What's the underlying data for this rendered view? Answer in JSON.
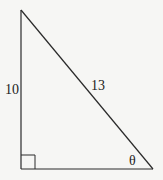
{
  "diagram": {
    "type": "right-triangle",
    "background": "#f6f6f4",
    "stroke_color": "#2a2a2a",
    "vertices": {
      "top": [
        21,
        10
      ],
      "right_angle": [
        21,
        169
      ],
      "acute": [
        153,
        169
      ]
    },
    "labels": {
      "vertical_leg": "10",
      "hypotenuse": "13",
      "angle": "θ"
    },
    "right_angle_marker": true
  }
}
